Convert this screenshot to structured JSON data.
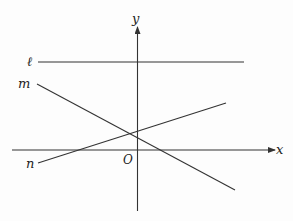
{
  "diagram": {
    "type": "coordinate-plane-lines",
    "axes": {
      "x_label": "x",
      "y_label": "y",
      "origin_label": "O"
    },
    "lines": [
      {
        "name": "line-l",
        "label": "ℓ",
        "description": "horizontal line above x-axis"
      },
      {
        "name": "line-m",
        "label": "m",
        "description": "line with negative slope"
      },
      {
        "name": "line-n",
        "label": "n",
        "description": "line with positive slope"
      }
    ],
    "colors": {
      "stroke": "#333333",
      "background": "#fdfdfd"
    }
  }
}
